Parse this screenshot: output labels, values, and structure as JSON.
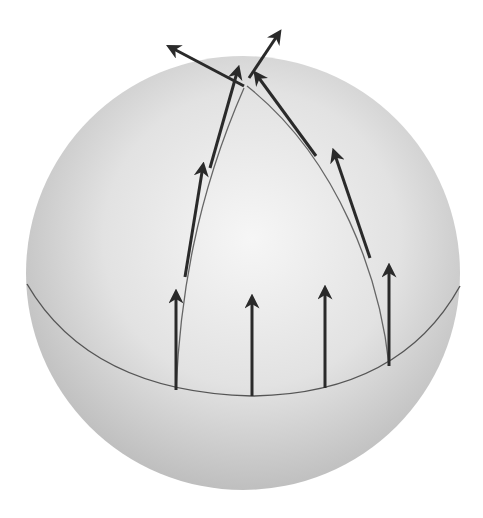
{
  "figure": {
    "background": "#ffffff",
    "sphere": {
      "cx": 243,
      "cy": 273,
      "r": 217,
      "fill_light": "#f4f4f4",
      "fill_dark": "#bdbdbd"
    },
    "equator": {
      "path": "M27,284 Q90,392 252,396 Q400,394 460,286",
      "color": "#555555"
    },
    "meridians": [
      {
        "name": "left-meridian",
        "path": "M176,390 C180,300 195,200 244,88",
        "color": "#666666"
      },
      {
        "name": "right-meridian",
        "path": "M389,365 C380,280 340,160 247,86",
        "color": "#666666"
      }
    ],
    "arrow_color": "#2a2a2a",
    "arrows": [
      {
        "name": "equator-arrow-1",
        "x1": 176,
        "y1": 390,
        "x2": 176,
        "y2": 293
      },
      {
        "name": "equator-arrow-2",
        "x1": 252,
        "y1": 396,
        "x2": 252,
        "y2": 298
      },
      {
        "name": "equator-arrow-3",
        "x1": 325,
        "y1": 388,
        "x2": 325,
        "y2": 289
      },
      {
        "name": "equator-arrow-4",
        "x1": 389,
        "y1": 366,
        "x2": 389,
        "y2": 267
      },
      {
        "name": "left-meridian-arrow-1",
        "x1": 185,
        "y1": 277,
        "x2": 203,
        "y2": 166
      },
      {
        "name": "left-meridian-arrow-2",
        "x1": 210,
        "y1": 168,
        "x2": 238,
        "y2": 69
      },
      {
        "name": "pole-arrow-left",
        "x1": 244,
        "y1": 86,
        "x2": 170,
        "y2": 47
      },
      {
        "name": "pole-arrow-right",
        "x1": 249,
        "y1": 78,
        "x2": 279,
        "y2": 33
      },
      {
        "name": "right-meridian-arrow-1",
        "x1": 316,
        "y1": 156,
        "x2": 256,
        "y2": 74
      },
      {
        "name": "right-meridian-arrow-2",
        "x1": 370,
        "y1": 258,
        "x2": 334,
        "y2": 152
      }
    ]
  }
}
